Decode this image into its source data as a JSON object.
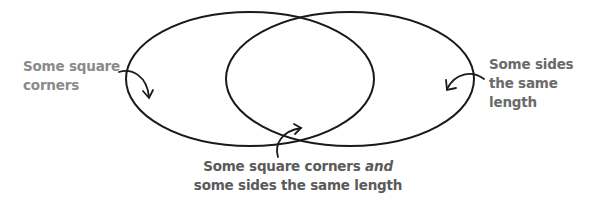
{
  "diagram": {
    "type": "venn",
    "sets": [
      {
        "id": "left",
        "label": "Some square corners"
      },
      {
        "id": "right",
        "label": "Some sides the same length"
      }
    ],
    "intersection": {
      "label_part1": "Some square corners ",
      "label_emphasis": "and",
      "label_part2": "some sides the same length"
    },
    "labels": {
      "left_line1": "Some square",
      "left_line2": "corners",
      "right_line1": "Some sides",
      "right_line2": "the same",
      "right_line3": "length"
    },
    "colors": {
      "stroke": "#1a1a1a",
      "label_left": "#8a8a8a",
      "label_right": "#6a6a6a",
      "label_bottom": "#5a5a5a",
      "background": "#ffffff"
    }
  }
}
